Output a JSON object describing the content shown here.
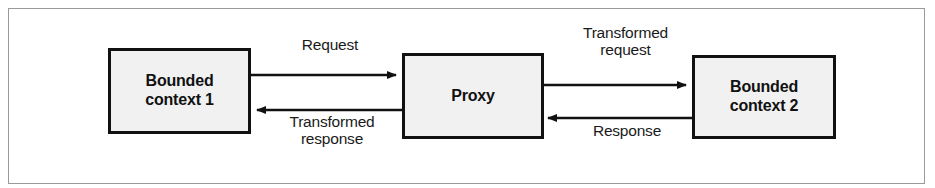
{
  "figure": {
    "type": "flow-diagram",
    "colors": {
      "frame_border": "#9a9a9a",
      "node_fill": "#f1f1f1",
      "node_border": "#111111",
      "text": "#111111",
      "arrow": "#111111",
      "background": "#ffffff"
    }
  },
  "nodes": [
    {
      "id": "bounded-context-1",
      "label": "Bounded\ncontext 1"
    },
    {
      "id": "proxy",
      "label": "Proxy"
    },
    {
      "id": "bounded-context-2",
      "label": "Bounded\ncontext 2"
    }
  ],
  "edges": [
    {
      "id": "request",
      "label": "Request",
      "from": "bounded-context-1",
      "to": "proxy",
      "direction": "right"
    },
    {
      "id": "transformed-response",
      "label": "Transformed\nresponse",
      "from": "proxy",
      "to": "bounded-context-1",
      "direction": "left"
    },
    {
      "id": "transformed-request",
      "label": "Transformed\nrequest",
      "from": "proxy",
      "to": "bounded-context-2",
      "direction": "right"
    },
    {
      "id": "response",
      "label": "Response",
      "from": "bounded-context-2",
      "to": "proxy",
      "direction": "left"
    }
  ]
}
